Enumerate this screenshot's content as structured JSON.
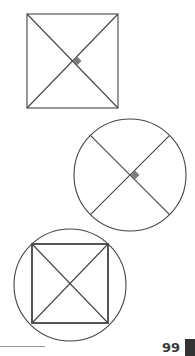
{
  "page": {
    "number": "99",
    "colors": {
      "stroke": "#444444",
      "marker": "#7d7d7d",
      "tab": "#333333",
      "rule": "#9a9a9a"
    }
  },
  "figures": [
    {
      "name": "square-with-diagonals",
      "shape": "square",
      "x": 27,
      "y": 14,
      "w": 91,
      "h": 94,
      "diagonals": true,
      "right_angle_marker": true
    },
    {
      "name": "circle-with-perpendicular-diameters",
      "shape": "circle",
      "cx": 130,
      "cy": 175,
      "r": 56,
      "diameters": true,
      "right_angle_marker": true
    },
    {
      "name": "square-inscribed-in-circle",
      "shape": "circle+square",
      "cx": 70,
      "cy": 285,
      "r": 56,
      "square": {
        "x": 32,
        "y": 244,
        "w": 76,
        "h": 79
      },
      "diagonals": true
    }
  ]
}
